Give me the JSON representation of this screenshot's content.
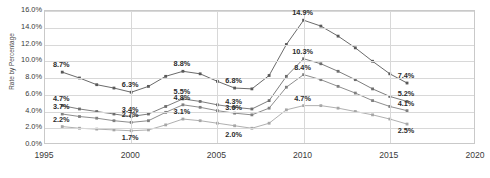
{
  "axis": {
    "ylabel": "Rate by Percentage",
    "yticks": [
      "16.0%",
      "14.0%",
      "12.0%",
      "10.0%",
      "8.0%",
      "6.0%",
      "4.0%",
      "2.0%",
      "0.0%"
    ],
    "xticks": [
      "1995",
      "2000",
      "2005",
      "2010",
      "2015",
      "2020"
    ]
  },
  "chart_data": {
    "type": "line",
    "title": "",
    "xlabel": "",
    "ylabel": "Rate by Percentage",
    "xlim": [
      1995,
      2020
    ],
    "ylim": [
      0,
      16
    ],
    "ytick_values": [
      0,
      2,
      4,
      6,
      8,
      10,
      12,
      14,
      16
    ],
    "xtick_values": [
      1995,
      2000,
      2005,
      2010,
      2015,
      2020
    ],
    "grid": true,
    "legend": "none",
    "x": [
      1996,
      1997,
      1998,
      1999,
      2000,
      2001,
      2002,
      2003,
      2004,
      2005,
      2006,
      2007,
      2008,
      2009,
      2010,
      2011,
      2012,
      2013,
      2014,
      2015,
      2016
    ],
    "series": [
      {
        "name": "series-1",
        "color": "#595959",
        "values": [
          8.7,
          8.0,
          7.2,
          6.8,
          6.3,
          7.0,
          8.2,
          8.8,
          8.5,
          7.6,
          6.8,
          6.7,
          8.3,
          12.0,
          14.9,
          14.2,
          13.0,
          11.6,
          10.0,
          8.5,
          7.4
        ]
      },
      {
        "name": "series-2",
        "color": "#6e6e6e",
        "values": [
          4.7,
          4.3,
          4.0,
          3.7,
          3.4,
          3.7,
          4.6,
          5.5,
          5.2,
          4.8,
          4.5,
          4.3,
          5.3,
          8.2,
          10.3,
          9.7,
          8.8,
          7.8,
          6.7,
          5.8,
          5.2
        ]
      },
      {
        "name": "series-3",
        "color": "#808080",
        "values": [
          3.7,
          3.4,
          3.2,
          2.9,
          2.7,
          2.9,
          3.9,
          4.8,
          4.5,
          4.1,
          3.8,
          3.6,
          4.4,
          6.9,
          8.4,
          7.8,
          7.0,
          6.2,
          5.3,
          4.6,
          4.1
        ]
      },
      {
        "name": "series-4",
        "color": "#a6a6a6",
        "values": [
          2.2,
          2.0,
          1.9,
          1.8,
          1.7,
          1.8,
          2.4,
          3.1,
          2.9,
          2.6,
          2.3,
          2.0,
          2.6,
          4.2,
          4.7,
          4.7,
          4.4,
          4.0,
          3.6,
          3.1,
          2.5
        ]
      }
    ],
    "data_labels": [
      {
        "text": "8.7%",
        "x": 1996,
        "y": 8.7,
        "pos": "above"
      },
      {
        "text": "6.3%",
        "x": 2000,
        "y": 6.3,
        "pos": "above"
      },
      {
        "text": "8.8%",
        "x": 2003,
        "y": 8.8,
        "pos": "above"
      },
      {
        "text": "6.8%",
        "x": 2006,
        "y": 6.8,
        "pos": "above"
      },
      {
        "text": "14.9%",
        "x": 2010,
        "y": 14.9,
        "pos": "above"
      },
      {
        "text": "7.4%",
        "x": 2016,
        "y": 7.4,
        "pos": "above"
      },
      {
        "text": "4.7%",
        "x": 1996,
        "y": 4.7,
        "pos": "above"
      },
      {
        "text": "3.4%",
        "x": 2000,
        "y": 3.4,
        "pos": "above"
      },
      {
        "text": "5.5%",
        "x": 2003,
        "y": 5.5,
        "pos": "above"
      },
      {
        "text": "4.3%",
        "x": 2006,
        "y": 4.3,
        "pos": "above"
      },
      {
        "text": "10.3%",
        "x": 2010,
        "y": 10.3,
        "pos": "above"
      },
      {
        "text": "5.2%",
        "x": 2016,
        "y": 5.2,
        "pos": "above"
      },
      {
        "text": "3.7%",
        "x": 1996,
        "y": 3.7,
        "pos": "above"
      },
      {
        "text": "2.7%",
        "x": 2000,
        "y": 2.7,
        "pos": "above"
      },
      {
        "text": "4.8%",
        "x": 2003,
        "y": 4.8,
        "pos": "above"
      },
      {
        "text": "3.6%",
        "x": 2006,
        "y": 3.6,
        "pos": "above"
      },
      {
        "text": "8.4%",
        "x": 2010,
        "y": 8.4,
        "pos": "above"
      },
      {
        "text": "4.1%",
        "x": 2016,
        "y": 4.1,
        "pos": "above"
      },
      {
        "text": "2.2%",
        "x": 1996,
        "y": 2.2,
        "pos": "above"
      },
      {
        "text": "1.7%",
        "x": 2000,
        "y": 1.7,
        "pos": "below"
      },
      {
        "text": "3.1%",
        "x": 2003,
        "y": 3.1,
        "pos": "above"
      },
      {
        "text": "2.0%",
        "x": 2006,
        "y": 2.0,
        "pos": "below"
      },
      {
        "text": "4.7%",
        "x": 2010,
        "y": 4.7,
        "pos": "above"
      },
      {
        "text": "2.5%",
        "x": 2016,
        "y": 2.5,
        "pos": "below"
      }
    ]
  }
}
